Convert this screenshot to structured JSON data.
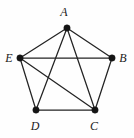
{
  "figure": {
    "kind": "undirected-graph-diagram",
    "width": 134,
    "height": 138,
    "background_color": "#fefefe",
    "edge_color": "#232323",
    "vertex_color": "#141414"
  },
  "chart_data": {
    "type": "diagram",
    "title": "",
    "xlabel": "",
    "ylabel": "",
    "grid": false,
    "legend": "none",
    "graph": {
      "layout": "regular-pentagon",
      "vertex_count": 5,
      "edge_count": 9,
      "vertices": [
        {
          "id": "A",
          "label": "A",
          "x": 67,
          "y": 28,
          "label_x": 64,
          "label_y": 12,
          "degree": 4
        },
        {
          "id": "B",
          "label": "B",
          "x": 112,
          "y": 58,
          "label_x": 123,
          "label_y": 58,
          "degree": 3
        },
        {
          "id": "C",
          "label": "C",
          "x": 95,
          "y": 110,
          "label_x": 94,
          "label_y": 126,
          "degree": 4
        },
        {
          "id": "D",
          "label": "D",
          "x": 36,
          "y": 110,
          "label_x": 35,
          "label_y": 126,
          "degree": 3
        },
        {
          "id": "E",
          "label": "E",
          "x": 20,
          "y": 58,
          "label_x": 9,
          "label_y": 58,
          "degree": 4
        }
      ],
      "edges": [
        {
          "from": "A",
          "to": "B"
        },
        {
          "from": "A",
          "to": "C"
        },
        {
          "from": "A",
          "to": "D"
        },
        {
          "from": "A",
          "to": "E"
        },
        {
          "from": "B",
          "to": "C"
        },
        {
          "from": "B",
          "to": "E"
        },
        {
          "from": "C",
          "to": "D"
        },
        {
          "from": "C",
          "to": "E"
        },
        {
          "from": "D",
          "to": "E"
        }
      ],
      "missing_edges": [
        {
          "from": "B",
          "to": "D"
        }
      ]
    }
  }
}
